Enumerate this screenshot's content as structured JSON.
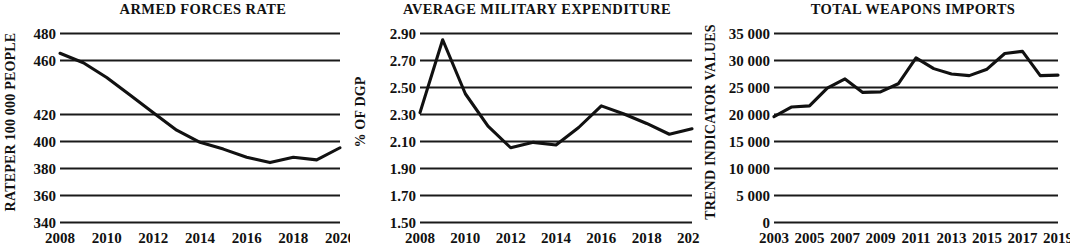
{
  "page": {
    "background": "#ffffff",
    "ink": "#111111",
    "layout": "three-panel-line-chart-row"
  },
  "chart_data": [
    {
      "type": "line",
      "panel_index": 1,
      "title": "ARMED FORCES RATE",
      "xlabel": "",
      "ylabel": "RATEPER 100 000 PEOPLE",
      "x": [
        2008,
        2009,
        2010,
        2011,
        2012,
        2013,
        2014,
        2015,
        2016,
        2017,
        2018,
        2019,
        2020
      ],
      "values": [
        465,
        458,
        447,
        434,
        421,
        408,
        399,
        394,
        388,
        384,
        388,
        386,
        395
      ],
      "categories": [
        "2008",
        "2009",
        "2010",
        "2011",
        "2012",
        "2013",
        "2014",
        "2015",
        "2016",
        "2017",
        "2018",
        "2019",
        "2020"
      ],
      "xtick_labels": [
        "2008",
        "2010",
        "2012",
        "2014",
        "2016",
        "2018",
        "2020"
      ],
      "xtick_values": [
        2008,
        2010,
        2012,
        2014,
        2016,
        2018,
        2020
      ],
      "ytick_labels": [
        "480",
        "460",
        "420",
        "400",
        "380",
        "360",
        "340"
      ],
      "ytick_values": [
        480,
        460,
        420,
        400,
        380,
        360,
        340
      ],
      "ylim": [
        340,
        480
      ],
      "xlim": [
        2008,
        2020
      ],
      "grid": true,
      "legend": "none",
      "line_color": "#111111"
    },
    {
      "type": "line",
      "panel_index": 2,
      "title": "AVERAGE MILITARY EXPENDITURE",
      "xlabel": "",
      "ylabel": "% OF DGP",
      "x": [
        2008,
        2009,
        2010,
        2011,
        2012,
        2013,
        2014,
        2015,
        2016,
        2017,
        2018,
        2019,
        2020
      ],
      "values": [
        2.31,
        2.85,
        2.45,
        2.21,
        2.05,
        2.09,
        2.07,
        2.2,
        2.36,
        2.3,
        2.23,
        2.15,
        2.19
      ],
      "categories": [
        "2008",
        "2009",
        "2010",
        "2011",
        "2012",
        "2013",
        "2014",
        "2015",
        "2016",
        "2017",
        "2018",
        "2019",
        "2020"
      ],
      "xtick_labels": [
        "2008",
        "2010",
        "2012",
        "2014",
        "2016",
        "2018",
        "2020"
      ],
      "xtick_values": [
        2008,
        2010,
        2012,
        2014,
        2016,
        2018,
        2020
      ],
      "ytick_labels": [
        "2.90",
        "2.70",
        "2.50",
        "2.30",
        "2.10",
        "1.90",
        "1.70",
        "1.50"
      ],
      "ytick_values": [
        2.9,
        2.7,
        2.5,
        2.3,
        2.1,
        1.9,
        1.7,
        1.5
      ],
      "ylim": [
        1.5,
        2.9
      ],
      "xlim": [
        2008,
        2020
      ],
      "grid": true,
      "legend": "none",
      "line_color": "#111111"
    },
    {
      "type": "line",
      "panel_index": 3,
      "title": "TOTAL WEAPONS IMPORTS",
      "xlabel": "",
      "ylabel": "TREND INDICATOR VALUES",
      "x": [
        2003,
        2004,
        2005,
        2006,
        2007,
        2008,
        2009,
        2010,
        2011,
        2012,
        2013,
        2014,
        2015,
        2016,
        2017,
        2018,
        2019
      ],
      "values": [
        19500,
        21300,
        21500,
        24800,
        26500,
        24000,
        24100,
        25600,
        30400,
        28400,
        27400,
        27100,
        28300,
        31200,
        31600,
        27100,
        27200
      ],
      "categories": [
        "2003",
        "2004",
        "2005",
        "2006",
        "2007",
        "2008",
        "2009",
        "2010",
        "2011",
        "2012",
        "2013",
        "2014",
        "2015",
        "2016",
        "2017",
        "2018",
        "2019"
      ],
      "xtick_labels": [
        "2003",
        "2005",
        "2007",
        "2009",
        "2011",
        "2013",
        "2015",
        "2017",
        "2019"
      ],
      "xtick_values": [
        2003,
        2005,
        2007,
        2009,
        2011,
        2013,
        2015,
        2017,
        2019
      ],
      "ytick_labels": [
        "35 000",
        "30 000",
        "25 000",
        "20 000",
        "15 000",
        "10 000",
        "5 000",
        "0"
      ],
      "ytick_values": [
        35000,
        30000,
        25000,
        20000,
        15000,
        10000,
        5000,
        0
      ],
      "ylim": [
        0,
        35000
      ],
      "xlim": [
        2003,
        2019
      ],
      "grid": true,
      "legend": "none",
      "line_color": "#111111"
    }
  ]
}
